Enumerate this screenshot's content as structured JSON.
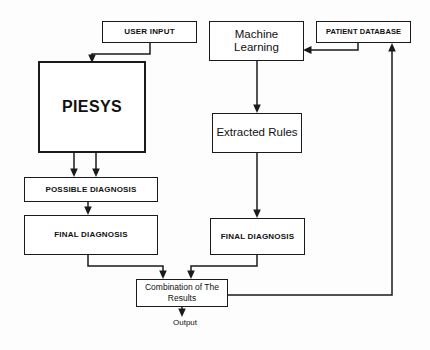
{
  "figure": {
    "width": 430,
    "height": 350,
    "background_color": "#fdfdfd",
    "line_color": "#1a1a1a",
    "text_color": "#111111"
  },
  "nodes": {
    "user_input": {
      "label": "USER INPUT"
    },
    "piesys": {
      "label": "PIESYS"
    },
    "machine_learning": {
      "label": "Machine Learning"
    },
    "patient_database": {
      "label": "PATIENT DATABASE"
    },
    "extracted_rules": {
      "label": "Extracted Rules"
    },
    "possible_diagnosis": {
      "label": "POSSIBLE DIAGNOSIS"
    },
    "final_diagnosis_left": {
      "label": "FINAL DIAGNOSIS"
    },
    "final_diagnosis_right": {
      "label": "FINAL DIAGNOSIS"
    },
    "combination": {
      "label": "Combination of The Results"
    }
  },
  "labels": {
    "output": "Output"
  },
  "edges": [
    {
      "name": "user-input-to-piesys",
      "from": "user_input",
      "to": "piesys",
      "arrow": true
    },
    {
      "name": "patient-database-to-machine-learning",
      "from": "patient_database",
      "to": "machine_learning",
      "arrow": true
    },
    {
      "name": "machine-learning-to-extracted-rules",
      "from": "machine_learning",
      "to": "extracted_rules",
      "arrow": true
    },
    {
      "name": "extracted-rules-to-final-diagnosis-right",
      "from": "extracted_rules",
      "to": "final_diagnosis_right",
      "arrow": true
    },
    {
      "name": "piesys-to-possible-diagnosis-a",
      "from": "piesys",
      "to": "possible_diagnosis",
      "arrow": true
    },
    {
      "name": "piesys-to-possible-diagnosis-b",
      "from": "piesys",
      "to": "possible_diagnosis",
      "arrow": true
    },
    {
      "name": "possible-diagnosis-to-final-diagnosis-left",
      "from": "possible_diagnosis",
      "to": "final_diagnosis_left",
      "arrow": true
    },
    {
      "name": "final-diagnosis-left-to-combination",
      "from": "final_diagnosis_left",
      "to": "combination",
      "arrow": true
    },
    {
      "name": "final-diagnosis-right-to-combination",
      "from": "final_diagnosis_right",
      "to": "combination",
      "arrow": true
    },
    {
      "name": "combination-to-output",
      "from": "combination",
      "to": "output",
      "arrow": true
    },
    {
      "name": "combination-to-patient-database-feedback",
      "from": "combination",
      "to": "patient_database",
      "arrow": true
    }
  ]
}
